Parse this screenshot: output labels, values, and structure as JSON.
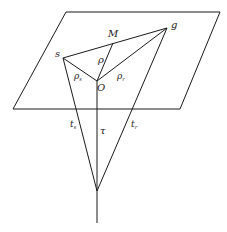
{
  "diagram": {
    "stroke_color": "#1a1a1a",
    "plane": {
      "points": [
        [
          66,
          12
        ],
        [
          220,
          12
        ],
        [
          180,
          109
        ],
        [
          13,
          109
        ]
      ]
    },
    "points": {
      "s": [
        63,
        58
      ],
      "M": [
        113,
        43
      ],
      "g": [
        167,
        28
      ],
      "O": [
        97,
        81
      ],
      "apex": [
        97,
        191
      ],
      "bottom": [
        97,
        223
      ]
    },
    "labels": {
      "s": "s",
      "M": "M",
      "g": "g",
      "O": "O",
      "rho": "ρ",
      "rho_s": "ρ",
      "rho_s_sub": "s",
      "rho_r": "ρ",
      "rho_r_sub": "r",
      "t_s": "t",
      "t_s_sub": "s",
      "tau": "τ",
      "t_r": "t",
      "t_r_sub": "r"
    }
  }
}
